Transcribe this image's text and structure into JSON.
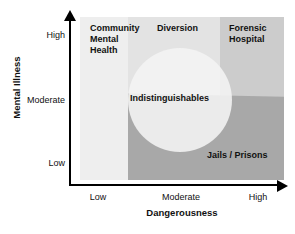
{
  "chart_data": {
    "type": "diagram",
    "title": "",
    "xlabel": "Dangerousness",
    "ylabel": "Mental Illness",
    "x_ticks": [
      "Low",
      "Moderate",
      "High"
    ],
    "y_ticks": [
      "High",
      "Moderate",
      "Low"
    ],
    "grid": false,
    "legend": "none",
    "regions": [
      {
        "name": "community-mental-health",
        "label": "Community\nMental\nHealth",
        "color": "#eeeeee",
        "x_range": [
          "Low",
          "Low-Moderate"
        ],
        "y_range": [
          "Low",
          "High"
        ]
      },
      {
        "name": "diversion",
        "label": "Diversion",
        "color": "#e3e3e3",
        "x_range": [
          "Low-Moderate",
          "Moderate-High"
        ],
        "y_range": [
          "Low",
          "High"
        ]
      },
      {
        "name": "forensic-hospital",
        "label": "Forensic\nHospital",
        "color": "#cccccc",
        "x_range": [
          "Moderate-High",
          "High"
        ],
        "y_range": [
          "Low",
          "High"
        ]
      },
      {
        "name": "jails-prisons",
        "label": "Jails / Prisons",
        "color": "#a8a8a8",
        "x_range": [
          "Low-Moderate",
          "High"
        ],
        "y_range": [
          "Low",
          "Moderate"
        ]
      },
      {
        "name": "indistinguishables",
        "label": "Indistinguishables",
        "color": "#f4f4f4",
        "shape": "circle",
        "center": [
          "Moderate",
          "Moderate"
        ],
        "x_range": [
          "Low-Moderate",
          "Moderate-High"
        ],
        "y_range": [
          "Low-Moderate",
          "Moderate-High"
        ]
      }
    ]
  },
  "axes": {
    "y": {
      "title": "Mental Illness",
      "ticks": {
        "high": "High",
        "moderate": "Moderate",
        "low": "Low"
      }
    },
    "x": {
      "title": "Dangerousness",
      "ticks": {
        "low": "Low",
        "moderate": "Moderate",
        "high": "High"
      }
    }
  },
  "labels": {
    "community_mental_health": "Community\nMental\nHealth",
    "diversion": "Diversion",
    "forensic_hospital": "Forensic\nHospital",
    "indistinguishables": "Indistinguishables",
    "jails_prisons": "Jails / Prisons"
  },
  "colors": {
    "community_mental_health": "#eeeeee",
    "diversion": "#e3e3e3",
    "forensic_hospital": "#cccccc",
    "jails_prisons": "#a8a8a8",
    "indistinguishables": "#f4f4f4",
    "axis": "#000000",
    "text": "#111111",
    "background": "#ffffff"
  }
}
